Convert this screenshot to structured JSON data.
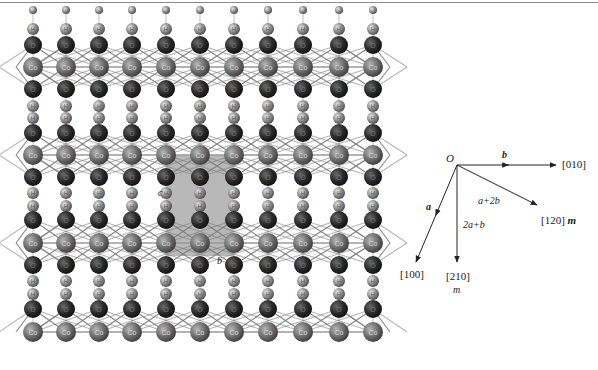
{
  "figure": {
    "structure": {
      "description": "CoOOH layered structure projected along [001], columns of H-O-Co-O-H atoms with Co-O bond network",
      "columns_x": [
        33,
        66,
        99,
        132,
        166,
        200,
        234,
        268,
        303,
        339,
        373
      ],
      "rows": [
        {
          "type": "H",
          "y": 10,
          "partial": true
        },
        {
          "type": "H",
          "y": 29
        },
        {
          "type": "O",
          "y": 45
        },
        {
          "type": "Co",
          "y": 67
        },
        {
          "type": "O",
          "y": 89
        },
        {
          "type": "H",
          "y": 106
        },
        {
          "type": "H",
          "y": 118
        },
        {
          "type": "O",
          "y": 133
        },
        {
          "type": "Co",
          "y": 155
        },
        {
          "type": "O",
          "y": 177
        },
        {
          "type": "H",
          "y": 193
        },
        {
          "type": "H",
          "y": 206
        },
        {
          "type": "O",
          "y": 220
        },
        {
          "type": "Co",
          "y": 243
        },
        {
          "type": "O",
          "y": 265
        },
        {
          "type": "H",
          "y": 281
        },
        {
          "type": "H",
          "y": 294
        },
        {
          "type": "O",
          "y": 309
        },
        {
          "type": "Co",
          "y": 332
        }
      ],
      "atom_labels": {
        "Co": "Co",
        "O": "O",
        "H": "H"
      },
      "atom_colors": {
        "Co": "#6e6e6e",
        "O": "#2a2a2a",
        "H": "#8c8c8c"
      },
      "bond_color": "#7a7a7a",
      "unit_cell": {
        "x": 166,
        "y": 155,
        "width": 68,
        "height": 101,
        "color": "#b8b8b8"
      },
      "cell_labels": {
        "c": "c",
        "b": "b"
      }
    },
    "vectors": {
      "origin_label": "O",
      "origin": [
        457,
        165
      ],
      "arrows": [
        {
          "id": "010",
          "to": [
            556,
            165
          ],
          "label": "[010]",
          "axis_label": "b"
        },
        {
          "id": "120",
          "to": [
            537,
            205
          ],
          "label": "[120]",
          "mirror": "m",
          "axis_label": "a+2b"
        },
        {
          "id": "210",
          "to": [
            457,
            262
          ],
          "label": "[210]",
          "mirror": "m",
          "axis_label": "2a+b"
        },
        {
          "id": "100",
          "to": [
            416,
            262
          ],
          "label": "[100]",
          "axis_label": "a"
        }
      ]
    }
  }
}
